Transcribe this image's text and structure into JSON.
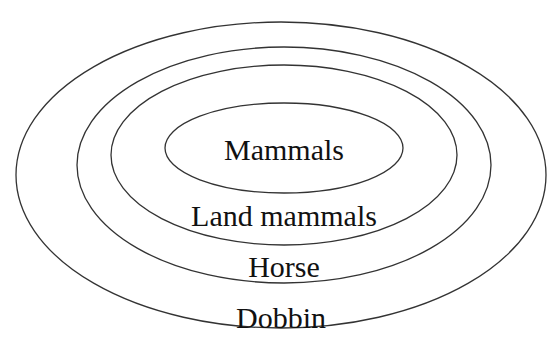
{
  "diagram": {
    "type": "nested-ellipses",
    "stroke_color": "#333333",
    "background": "#ffffff",
    "rings": [
      {
        "name": "outer",
        "label": "Dobbin",
        "cx": 281,
        "cy": 175,
        "rx": 265,
        "ry": 153,
        "label_x": 281,
        "label_y": 318
      },
      {
        "name": "second",
        "label": "Horse",
        "cx": 284,
        "cy": 165,
        "rx": 207,
        "ry": 118,
        "label_x": 284,
        "label_y": 267
      },
      {
        "name": "third",
        "label": "Land mammals",
        "cx": 284,
        "cy": 155,
        "rx": 173,
        "ry": 90,
        "label_x": 284,
        "label_y": 216
      },
      {
        "name": "inner",
        "label": "Mammals",
        "cx": 284,
        "cy": 148,
        "rx": 119,
        "ry": 45,
        "label_x": 284,
        "label_y": 150
      }
    ]
  }
}
